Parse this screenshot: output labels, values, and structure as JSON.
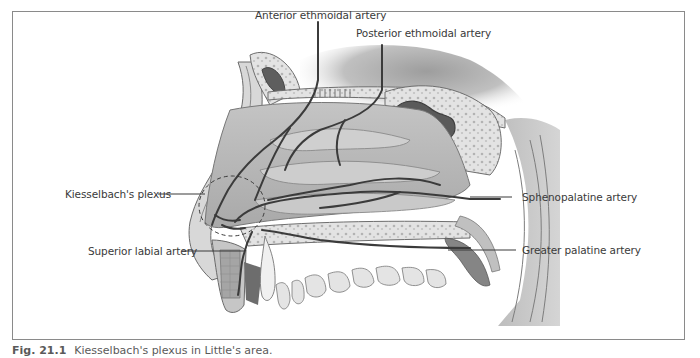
{
  "figure": {
    "caption_number": "Fig. 21.1",
    "caption_text": "Kiesselbach's plexus in Little's area.",
    "frame_color": "#8a8a8a"
  },
  "labels": {
    "anterior_ethmoidal": "Anterior ethmoidal artery",
    "posterior_ethmoidal": "Posterior ethmoidal artery",
    "kiesselbach": "Kiesselbach's plexus",
    "superior_labial": "Superior labial artery",
    "sphenopalatine": "Sphenopalatine artery",
    "greater_palatine": "Greater palatine artery"
  },
  "colors": {
    "artery": "#3b3b3b",
    "tissue_light": "#d9d9d9",
    "tissue_mid": "#b8b8b8",
    "tissue_dark": "#7a7a7a",
    "bone": "#e6e6e6",
    "sinus": "#5e5e5e",
    "leader_line": "#3a3a3a",
    "label_text": "#3a3a3a"
  }
}
